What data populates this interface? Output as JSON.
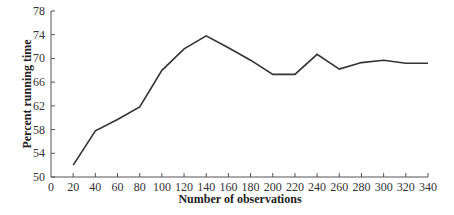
{
  "chart_data": {
    "type": "line",
    "title": "",
    "xlabel": "Number of observations",
    "ylabel": "Percent running time",
    "xlim": [
      0,
      340
    ],
    "ylim": [
      50,
      78
    ],
    "x_ticks": [
      0,
      20,
      40,
      60,
      80,
      100,
      120,
      140,
      160,
      180,
      200,
      220,
      240,
      260,
      280,
      300,
      320,
      340
    ],
    "y_ticks": [
      50,
      54,
      58,
      62,
      66,
      70,
      74,
      78
    ],
    "grid": false,
    "legend": null,
    "series": [
      {
        "name": "Percent running time",
        "color": "#333333",
        "x": [
          20,
          40,
          60,
          80,
          100,
          120,
          140,
          160,
          180,
          200,
          220,
          240,
          260,
          280,
          300,
          320,
          340
        ],
        "values": [
          52,
          57.8,
          59.7,
          61.8,
          68,
          71.6,
          73.8,
          71.8,
          69.7,
          67.3,
          67.3,
          70.7,
          68.2,
          69.3,
          69.7,
          69.2,
          69.2
        ]
      }
    ]
  }
}
